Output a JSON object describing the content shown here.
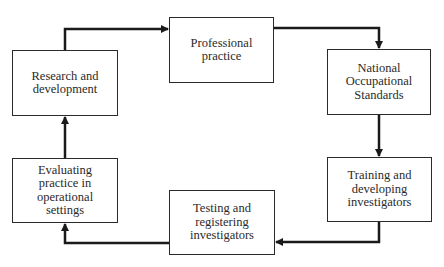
{
  "diagram": {
    "type": "cycle-flowchart",
    "nodes": [
      {
        "id": "research",
        "label": "Research and development"
      },
      {
        "id": "professional",
        "label": "Professional practice"
      },
      {
        "id": "nos",
        "label": "National Occupational Standards"
      },
      {
        "id": "training",
        "label": "Training and developing investigators"
      },
      {
        "id": "testing",
        "label": "Testing and registering investigators"
      },
      {
        "id": "evaluating",
        "label": "Evaluating practice in operational settings"
      }
    ],
    "edges": [
      {
        "from": "research",
        "to": "professional"
      },
      {
        "from": "professional",
        "to": "nos"
      },
      {
        "from": "nos",
        "to": "training"
      },
      {
        "from": "training",
        "to": "testing"
      },
      {
        "from": "testing",
        "to": "evaluating"
      },
      {
        "from": "evaluating",
        "to": "research"
      }
    ],
    "colors": {
      "line": "#1a1a1a",
      "box_border": "#2a2a2a",
      "background": "#ffffff"
    }
  }
}
